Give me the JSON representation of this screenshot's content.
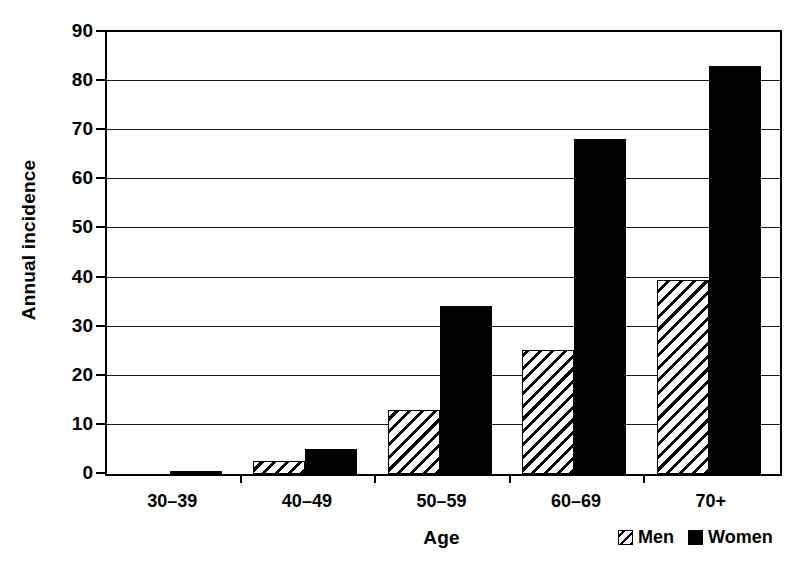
{
  "chart_data": {
    "type": "bar",
    "title": "",
    "subtitle": "",
    "xlabel": "Age",
    "ylabel": "Annual incidence",
    "categories": [
      "30–39",
      "40–49",
      "50–59",
      "60–69",
      "70+"
    ],
    "series": [
      {
        "name": "Men",
        "values": [
          0,
          2.7,
          13.0,
          25.2,
          39.5
        ],
        "pattern": "diagonal-hatch",
        "color": "#ffffff",
        "edge_color": "#000000"
      },
      {
        "name": "Women",
        "values": [
          0.5,
          5.1,
          34.3,
          68.2,
          83.0
        ],
        "pattern": "solid",
        "color": "#000000",
        "edge_color": "#000000"
      }
    ],
    "ylim": [
      0,
      90
    ],
    "yticks": [
      0,
      10,
      20,
      30,
      40,
      50,
      60,
      70,
      80,
      90
    ],
    "ytick_labels": [
      "0",
      "10",
      "20",
      "30",
      "40",
      "50",
      "60",
      "70",
      "80",
      "90"
    ],
    "grid": "horizontal",
    "legend_position": "bottom-right",
    "legend_entries": [
      "Men",
      "Women"
    ],
    "background": "#ffffff",
    "axis_color": "#000000"
  },
  "axes": {
    "y_title": "Annual incidence",
    "x_title": "Age"
  },
  "legend": {
    "items": [
      {
        "label": "Men",
        "swatch": "hatched-swatch-icon"
      },
      {
        "label": "Women",
        "swatch": "solid-black-swatch-icon"
      }
    ]
  }
}
